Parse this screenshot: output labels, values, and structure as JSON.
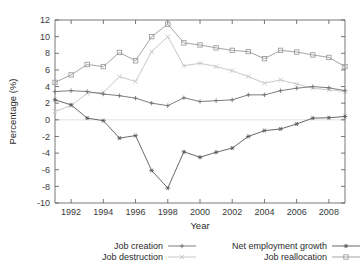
{
  "chart_data": {
    "type": "line",
    "title": "",
    "xlabel": "Year",
    "ylabel": "Percentage (%)",
    "xlim": [
      1991,
      2009
    ],
    "ylim": [
      -10,
      12
    ],
    "xticks": [
      1992,
      1994,
      1996,
      1998,
      2000,
      2002,
      2004,
      2006,
      2008
    ],
    "yticks": [
      12,
      10,
      8,
      6,
      4,
      2,
      0,
      -2,
      -4,
      -6,
      -8,
      -10
    ],
    "grid": false,
    "zero_line": true,
    "legend_position": "bottom",
    "x": [
      1991,
      1992,
      1993,
      1994,
      1995,
      1996,
      1997,
      1998,
      1999,
      2000,
      2001,
      2002,
      2003,
      2004,
      2005,
      2006,
      2007,
      2008,
      2009
    ],
    "series": [
      {
        "name": "Job creation",
        "marker": "plus",
        "color": "#6e6e6e",
        "values": [
          3.4,
          3.5,
          3.4,
          3.1,
          2.9,
          2.6,
          2.0,
          1.7,
          2.65,
          2.2,
          2.3,
          2.4,
          3.0,
          3.0,
          3.5,
          3.8,
          4.0,
          3.85,
          3.5
        ]
      },
      {
        "name": "Job destruction",
        "marker": "cross",
        "color": "#c2c2c2",
        "values": [
          1.0,
          1.7,
          3.2,
          3.3,
          5.2,
          4.6,
          8.2,
          10.0,
          6.5,
          6.8,
          6.4,
          5.9,
          5.2,
          4.4,
          4.8,
          4.3,
          3.8,
          3.6,
          3.4
        ]
      },
      {
        "name": "Net employment growth",
        "marker": "star",
        "color": "#585858",
        "values": [
          2.4,
          1.8,
          0.2,
          -0.1,
          -2.2,
          -1.9,
          -6.1,
          -8.2,
          -3.85,
          -4.5,
          -3.9,
          -3.4,
          -2.0,
          -1.3,
          -1.1,
          -0.5,
          0.2,
          0.25,
          0.4
        ]
      },
      {
        "name": "Job reallocation",
        "marker": "square",
        "color": "#9a9a9a",
        "values": [
          4.5,
          5.4,
          6.65,
          6.4,
          8.1,
          7.1,
          10.0,
          11.5,
          9.25,
          9.0,
          8.65,
          8.35,
          8.2,
          7.35,
          8.35,
          8.15,
          7.8,
          7.5,
          6.4
        ]
      }
    ]
  },
  "legend": {
    "entries": [
      {
        "label": "Job creation"
      },
      {
        "label": "Job destruction"
      },
      {
        "label": "Net employment growth"
      },
      {
        "label": "Job reallocation"
      }
    ]
  },
  "axes": {
    "x_title": "Year",
    "y_title": "Percentage (%)"
  }
}
